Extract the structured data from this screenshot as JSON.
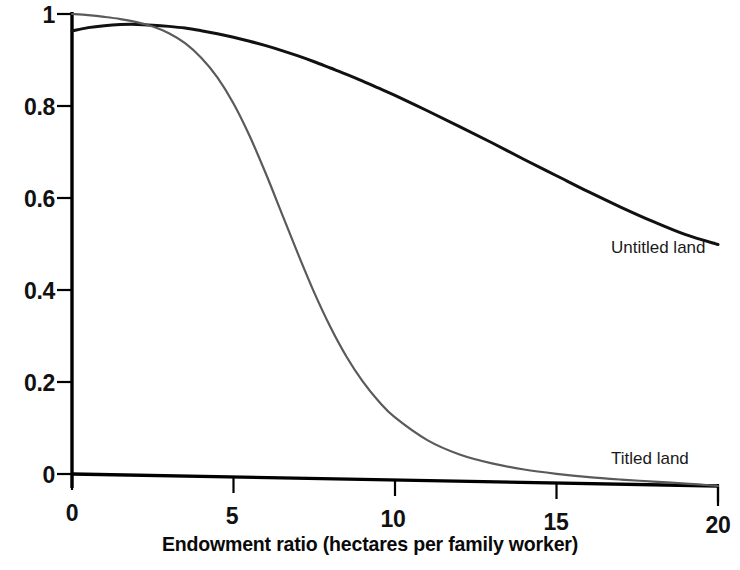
{
  "chart_data": {
    "type": "line",
    "title": "",
    "subtitle": "",
    "xlabel": "Endowment ratio (hectares per family worker)",
    "ylabel": "",
    "xlim": [
      0,
      20
    ],
    "ylim": [
      0,
      1
    ],
    "grid": false,
    "legend_position": "inline-annotation",
    "xticks": [
      0,
      5,
      10,
      15,
      20
    ],
    "xtick_labels": [
      "0",
      "5",
      "10",
      "15",
      "20"
    ],
    "yticks": [
      0,
      0.2,
      0.4,
      0.6,
      0.8,
      1
    ],
    "ytick_labels": [
      "0",
      "0.2",
      "0.4",
      "0.6",
      "0.8",
      "1"
    ],
    "x": [
      0,
      0.5,
      1,
      1.5,
      2,
      2.5,
      3,
      3.5,
      4,
      4.5,
      5,
      5.5,
      6,
      6.5,
      7,
      7.5,
      8,
      8.5,
      9,
      9.5,
      10,
      11,
      12,
      13,
      14,
      15,
      16,
      17,
      18,
      19,
      20
    ],
    "series": [
      {
        "name": "Untitled land",
        "color": "#111111",
        "annotation": "Untitled land",
        "annotation_x": 15.6,
        "annotation_y": 0.47,
        "values": [
          0.963,
          0.971,
          0.976,
          0.979,
          0.98,
          0.979,
          0.977,
          0.974,
          0.969,
          0.963,
          0.956,
          0.948,
          0.939,
          0.929,
          0.918,
          0.906,
          0.893,
          0.88,
          0.866,
          0.851,
          0.836,
          0.804,
          0.771,
          0.737,
          0.702,
          0.668,
          0.634,
          0.602,
          0.572,
          0.545,
          0.525
        ]
      },
      {
        "name": "Titled land",
        "color": "#5a5a5a",
        "annotation": "Titled land",
        "annotation_x": 15.6,
        "annotation_y": 0.075,
        "values": [
          1.0,
          0.998,
          0.995,
          0.991,
          0.985,
          0.976,
          0.962,
          0.941,
          0.91,
          0.868,
          0.812,
          0.742,
          0.661,
          0.574,
          0.487,
          0.404,
          0.33,
          0.266,
          0.213,
          0.17,
          0.136,
          0.088,
          0.058,
          0.04,
          0.028,
          0.02,
          0.014,
          0.01,
          0.007,
          0.004,
          0.0
        ]
      }
    ]
  },
  "axes": {
    "y_axis_name": "y-axis",
    "x_axis_name": "x-axis"
  }
}
